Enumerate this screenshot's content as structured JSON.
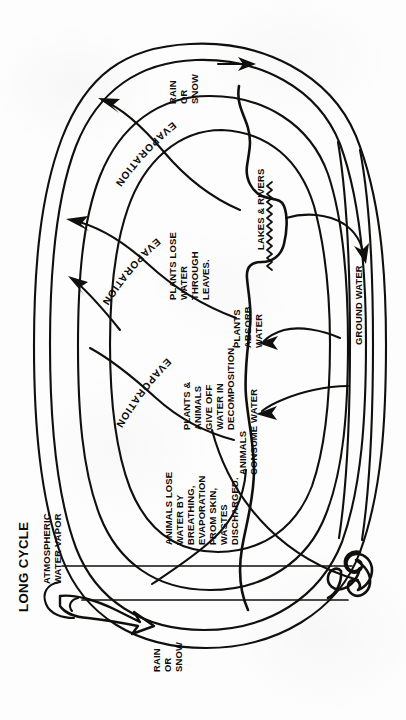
{
  "figure": {
    "title": "LONG CYCLE",
    "orientation": "rotated-90-ccw",
    "ink_color": "#100f0d",
    "paper_color": "#fdfdfd"
  },
  "labels": {
    "long_cycle": "LONG CYCLE",
    "atmospheric_water_vapor": [
      "ATMOSPHERIC",
      "WATER VAPOR"
    ],
    "rain_or_snow_top": [
      "RAIN",
      "OR",
      "SNOW"
    ],
    "rain_or_snow_bottom": [
      "RAIN",
      "OR",
      "SNOW"
    ],
    "evaporation_1": "EVAPORATION",
    "evaporation_2": "EVAPORATION",
    "evaporation_3": "EVAPORATION",
    "lakes_and_rivers": "LAKES & RIVERS",
    "ground_water": "GROUND WATER",
    "plants_lose_water": [
      "PLANTS LOSE",
      "WATER",
      "THROUGH",
      "LEAVES."
    ],
    "plants_absorb_water": [
      "PLANTS",
      "ABSORB",
      "WATER"
    ],
    "plants_animals_decomposition": [
      "PLANTS &",
      "ANIMALS",
      "GIVE OFF",
      "WATER IN",
      "DECOMPOSITION."
    ],
    "animals_consume_water": [
      "ANIMALS",
      "CONSUME WATER"
    ],
    "animals_lose_water": [
      "ANIMALS LOSE",
      "WATER BY",
      "BREATHING,",
      "EVAPORATION",
      "FROM SKIN,",
      "WASTES",
      "DISCHARGED."
    ]
  },
  "icons": {
    "arrow_rain_top": "arrow-right-icon",
    "arrow_rain_bottom": "open-arrow-icon",
    "arrow_evaporation_1": "arrow-up-icon",
    "arrow_evaporation_2": "arrow-up-icon",
    "arrow_evaporation_3": "arrow-up-icon",
    "arrow_lakes_to_ground": "arrow-curved-icon",
    "arrow_ground_to_plants": "arrow-curved-icon",
    "arrow_ground_to_animals": "arrow-curved-icon",
    "water_surface": "wavy-line-icon",
    "ocean_swirl": "swirl-wave-icon"
  }
}
